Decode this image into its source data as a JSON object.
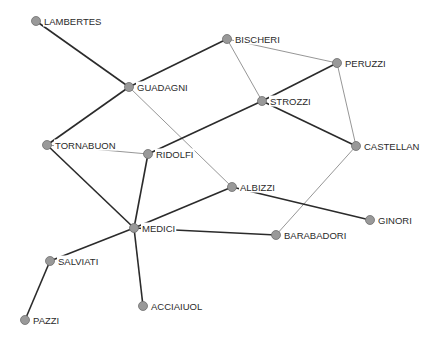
{
  "diagram": {
    "type": "network-graph",
    "node_color": "#999999",
    "strong_edge_color": "#2b2b2b",
    "weak_edge_color": "#8a8a8a",
    "nodes": [
      {
        "id": "LAMBERTES",
        "label": "LAMBERTES",
        "x": 36,
        "y": 21
      },
      {
        "id": "GUADAGNI",
        "label": "GUADAGNI",
        "x": 129,
        "y": 87
      },
      {
        "id": "BISCHERI",
        "label": "BISCHERI",
        "x": 227,
        "y": 39
      },
      {
        "id": "PERUZZI",
        "label": "PERUZZI",
        "x": 337,
        "y": 63
      },
      {
        "id": "STROZZI",
        "label": "STROZZI",
        "x": 262,
        "y": 101
      },
      {
        "id": "CASTELLAN",
        "label": "CASTELLAN",
        "x": 356,
        "y": 146
      },
      {
        "id": "TORNABUON",
        "label": "TORNABUON",
        "x": 47,
        "y": 145
      },
      {
        "id": "RIDOLFI",
        "label": "RIDOLFI",
        "x": 148,
        "y": 154
      },
      {
        "id": "ALBIZZI",
        "label": "ALBIZZI",
        "x": 232,
        "y": 187
      },
      {
        "id": "GINORI",
        "label": "GINORI",
        "x": 370,
        "y": 220
      },
      {
        "id": "MEDICI",
        "label": "MEDICI",
        "x": 134,
        "y": 228
      },
      {
        "id": "BARABADORI",
        "label": "BARABADORI",
        "x": 276,
        "y": 235
      },
      {
        "id": "SALVIATI",
        "label": "SALVIATI",
        "x": 50,
        "y": 261
      },
      {
        "id": "PAZZI",
        "label": "PAZZI",
        "x": 25,
        "y": 320
      },
      {
        "id": "ACCIAIUOL",
        "label": "ACCIAIUOL",
        "x": 143,
        "y": 306
      }
    ],
    "edges": [
      {
        "source": "LAMBERTES",
        "target": "GUADAGNI",
        "weight": "strong"
      },
      {
        "source": "GUADAGNI",
        "target": "BISCHERI",
        "weight": "strong"
      },
      {
        "source": "GUADAGNI",
        "target": "TORNABUON",
        "weight": "strong"
      },
      {
        "source": "GUADAGNI",
        "target": "ALBIZZI",
        "weight": "weak"
      },
      {
        "source": "BISCHERI",
        "target": "PERUZZI",
        "weight": "weak"
      },
      {
        "source": "BISCHERI",
        "target": "STROZZI",
        "weight": "weak"
      },
      {
        "source": "STROZZI",
        "target": "PERUZZI",
        "weight": "strong"
      },
      {
        "source": "STROZZI",
        "target": "CASTELLAN",
        "weight": "strong"
      },
      {
        "source": "STROZZI",
        "target": "RIDOLFI",
        "weight": "strong"
      },
      {
        "source": "PERUZZI",
        "target": "CASTELLAN",
        "weight": "weak"
      },
      {
        "source": "CASTELLAN",
        "target": "BARABADORI",
        "weight": "weak"
      },
      {
        "source": "TORNABUON",
        "target": "RIDOLFI",
        "weight": "weak"
      },
      {
        "source": "TORNABUON",
        "target": "MEDICI",
        "weight": "strong"
      },
      {
        "source": "RIDOLFI",
        "target": "MEDICI",
        "weight": "strong"
      },
      {
        "source": "MEDICI",
        "target": "ALBIZZI",
        "weight": "strong"
      },
      {
        "source": "ALBIZZI",
        "target": "GINORI",
        "weight": "strong"
      },
      {
        "source": "MEDICI",
        "target": "BARABADORI",
        "weight": "strong"
      },
      {
        "source": "MEDICI",
        "target": "SALVIATI",
        "weight": "strong"
      },
      {
        "source": "SALVIATI",
        "target": "PAZZI",
        "weight": "strong"
      },
      {
        "source": "MEDICI",
        "target": "ACCIAIUOL",
        "weight": "strong"
      }
    ]
  }
}
